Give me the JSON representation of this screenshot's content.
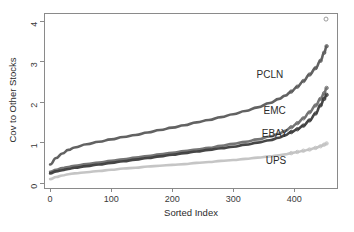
{
  "chart_data": {
    "type": "line",
    "title": "",
    "subtitle": "",
    "xlabel": "Sorted Index",
    "ylabel": "Cov to Other Stocks",
    "xlim": [
      -10,
      470
    ],
    "ylim": [
      -0.12,
      4.2
    ],
    "xticks": [
      0,
      100,
      200,
      300,
      400
    ],
    "xticklabels": [
      "0",
      "100",
      "200",
      "300",
      "400"
    ],
    "yticks": [
      0,
      1,
      2,
      3,
      4
    ],
    "yticklabels": [
      "0",
      "1",
      "2",
      "3",
      "4"
    ],
    "grid": false,
    "legend_position": "inline-right-annotations",
    "x": [
      0,
      10,
      20,
      30,
      40,
      60,
      80,
      100,
      120,
      140,
      160,
      180,
      200,
      220,
      240,
      260,
      280,
      300,
      320,
      340,
      360,
      375,
      385,
      395,
      405,
      415,
      425,
      435,
      443,
      449,
      453
    ],
    "series": [
      {
        "name": "PCLN",
        "color": "#5a5a5a",
        "label": "PCLN",
        "marker": "open-circle",
        "values": [
          0.46,
          0.62,
          0.73,
          0.82,
          0.88,
          0.96,
          1.02,
          1.08,
          1.14,
          1.19,
          1.25,
          1.31,
          1.37,
          1.43,
          1.5,
          1.56,
          1.63,
          1.7,
          1.78,
          1.87,
          1.98,
          2.08,
          2.16,
          2.26,
          2.38,
          2.52,
          2.68,
          2.84,
          3.02,
          3.22,
          3.38
        ]
      },
      {
        "name": "EMC",
        "color": "#6e6e6e",
        "label": "EMC",
        "marker": "open-circle",
        "values": [
          0.28,
          0.33,
          0.37,
          0.4,
          0.43,
          0.47,
          0.51,
          0.55,
          0.59,
          0.63,
          0.67,
          0.71,
          0.75,
          0.79,
          0.83,
          0.87,
          0.92,
          0.97,
          1.02,
          1.08,
          1.15,
          1.22,
          1.29,
          1.38,
          1.48,
          1.6,
          1.75,
          1.92,
          2.08,
          2.22,
          2.35
        ]
      },
      {
        "name": "EBAY",
        "color": "#3c3c3c",
        "label": "EBAY",
        "marker": "open-circle",
        "values": [
          0.24,
          0.29,
          0.32,
          0.35,
          0.38,
          0.42,
          0.46,
          0.5,
          0.54,
          0.58,
          0.62,
          0.66,
          0.7,
          0.74,
          0.78,
          0.82,
          0.86,
          0.9,
          0.95,
          1.0,
          1.06,
          1.12,
          1.18,
          1.26,
          1.33,
          1.42,
          1.55,
          1.72,
          1.92,
          2.08,
          2.18
        ]
      },
      {
        "name": "UPS",
        "color": "#c2c2c2",
        "label": "UPS",
        "marker": "open-circle",
        "values": [
          0.1,
          0.15,
          0.19,
          0.22,
          0.24,
          0.27,
          0.3,
          0.33,
          0.36,
          0.38,
          0.41,
          0.43,
          0.45,
          0.47,
          0.5,
          0.52,
          0.55,
          0.57,
          0.6,
          0.63,
          0.66,
          0.69,
          0.71,
          0.74,
          0.77,
          0.8,
          0.83,
          0.87,
          0.91,
          0.95,
          0.98
        ]
      }
    ],
    "annotations": [
      {
        "text": "PCLN",
        "x": 360,
        "y": 2.6
      },
      {
        "text": "EMC",
        "x": 368,
        "y": 1.7
      },
      {
        "text": "EBAY",
        "x": 368,
        "y": 1.13
      },
      {
        "text": "UPS",
        "x": 370,
        "y": 0.47
      }
    ],
    "outliers": [
      {
        "series": "PCLN",
        "x": 452,
        "y": 4.05
      }
    ]
  }
}
